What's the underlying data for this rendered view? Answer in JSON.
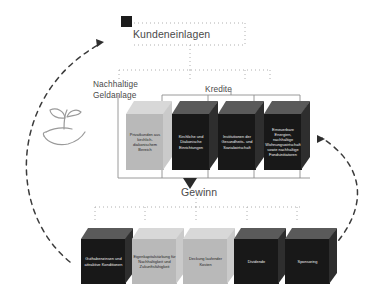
{
  "diagram": {
    "title_node": {
      "label": "Kundeneinlagen",
      "marker_name": "black-square-marker"
    },
    "branch_labels": {
      "left": "Nachhaltige\nGeldanlage",
      "right": "Kredite"
    },
    "profit_label": "Gewinn",
    "icon": {
      "name": "sprout-in-hand-icon",
      "meaning": "sustainable growth"
    },
    "middle_row": [
      {
        "id": "privatkunden",
        "text": "Privatkunden aus kirchlich-diakonischem Bereich",
        "tone": "light"
      },
      {
        "id": "kirchliche-diakonische",
        "text": "Kirchliche und Diakonische Einrichtungen",
        "tone": "dark"
      },
      {
        "id": "institutionen",
        "text": "Institutionen der Gesundheits- und Sozialwirtschaft",
        "tone": "dark"
      },
      {
        "id": "erneuerbare",
        "text": "Erneuerbare Energien, nachhaltige Wohnungswirtschaft sowie nachhaltige Fondsinitiatoren",
        "tone": "dark"
      }
    ],
    "bottom_row": [
      {
        "id": "guthabenzinsen",
        "text": "Guthabenzinsen und attraktive Konditionen",
        "tone": "dark"
      },
      {
        "id": "eigenkapital",
        "text": "Eigenkapitalstärkung für Nachhaltigkeit und Zukunftsfähigkeit",
        "tone": "light"
      },
      {
        "id": "deckung",
        "text": "Deckung laufender Kosten",
        "tone": "light"
      },
      {
        "id": "dividende",
        "text": "Dividende",
        "tone": "dark"
      },
      {
        "id": "sponsoring",
        "text": "Sponsoring",
        "tone": "dark"
      }
    ],
    "flow_arrows": [
      {
        "name": "left-dashed-return-arrow",
        "direction": "up-right"
      },
      {
        "name": "right-dashed-return-arrow",
        "direction": "up-left"
      },
      {
        "name": "gewinn-down-arrow",
        "direction": "down"
      }
    ],
    "colors": {
      "dark_box": "#181818",
      "dark_top": "#5a5a5a",
      "light_box": "#b9b9b9",
      "light_top": "#d8d8d8",
      "text": "#4a4a4a",
      "connector": "#8f8f8f",
      "dashed": "#3c3c3c"
    }
  }
}
